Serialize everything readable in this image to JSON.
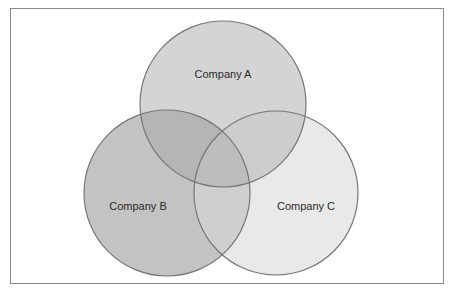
{
  "diagram": {
    "type": "venn",
    "circles": [
      {
        "id": "A",
        "label": "Company A",
        "cx": 223,
        "cy": 104,
        "r": 83,
        "fill": "#d4d4d4"
      },
      {
        "id": "B",
        "label": "Company B",
        "cx": 167,
        "cy": 193,
        "r": 83,
        "fill": "#c2c2c2"
      },
      {
        "id": "C",
        "label": "Company C",
        "cx": 276,
        "cy": 193,
        "r": 82,
        "fill": "#e9e9e9"
      }
    ],
    "stroke": "#777777",
    "frame_border": "#8a8a8a"
  }
}
